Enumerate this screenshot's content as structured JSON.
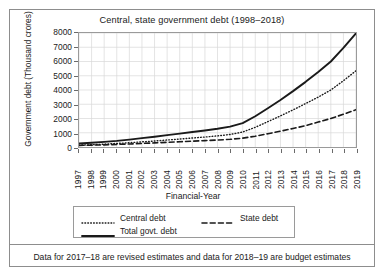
{
  "figure": {
    "title": "Central, state government debt (1998–2018)",
    "footnote": "Data for 2017–18 are revised estimates and data for 2018–19 are budget estimates",
    "frame_color": "#8d8d8d",
    "grid_color": "#d8d8d8",
    "line_color": "#1a1a1a"
  },
  "chart_data": {
    "type": "line",
    "title": "Central, state government debt (1998–2018)",
    "xlabel": "Financial-Year",
    "ylabel": "Government debt (Thousand crores)",
    "xlim": [
      1997,
      2019
    ],
    "ylim": [
      0,
      8000
    ],
    "ytick_step": 1000,
    "yticks": [
      0,
      1000,
      2000,
      3000,
      4000,
      5000,
      6000,
      7000,
      8000
    ],
    "grid": true,
    "legend_position": "below-axes",
    "x": [
      1997,
      1998,
      1999,
      2000,
      2001,
      2002,
      2003,
      2004,
      2005,
      2006,
      2007,
      2008,
      2009,
      2010,
      2011,
      2012,
      2013,
      2014,
      2015,
      2016,
      2017,
      2018,
      2019
    ],
    "xticklabels": [
      "1997",
      "1998",
      "1999",
      "2000",
      "2001",
      "2002",
      "2003",
      "2004",
      "2005",
      "2006",
      "2007",
      "2008",
      "2009",
      "2010",
      "2011",
      "2012",
      "2013",
      "2014",
      "2015",
      "2016",
      "2017",
      "2018",
      "2019"
    ],
    "series": [
      {
        "name": "Central debt",
        "style": "dotted",
        "values": [
          130,
          160,
          200,
          250,
          300,
          360,
          420,
          490,
          560,
          630,
          700,
          780,
          880,
          1050,
          1380,
          1780,
          2180,
          2600,
          3050,
          3500,
          4000,
          4650,
          5350
        ]
      },
      {
        "name": "State debt",
        "style": "dashed",
        "values": [
          110,
          130,
          150,
          180,
          210,
          250,
          290,
          330,
          370,
          410,
          450,
          490,
          540,
          620,
          760,
          930,
          1110,
          1300,
          1500,
          1750,
          2000,
          2300,
          2620
        ]
      },
      {
        "name": "Total govt. debt",
        "style": "solid",
        "values": [
          250,
          300,
          360,
          430,
          520,
          620,
          720,
          830,
          940,
          1050,
          1160,
          1280,
          1430,
          1680,
          2160,
          2720,
          3300,
          3920,
          4570,
          5260,
          6000,
          6950,
          7980
        ]
      }
    ]
  },
  "legend": {
    "items": [
      {
        "label": "Central debt",
        "style": "dotted"
      },
      {
        "label": "State debt",
        "style": "dashed"
      },
      {
        "label": "Total govt. debt",
        "style": "solid"
      }
    ]
  }
}
